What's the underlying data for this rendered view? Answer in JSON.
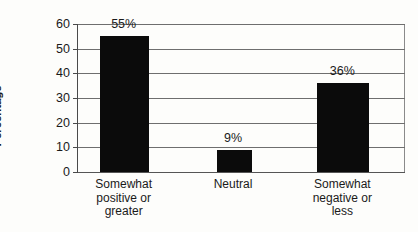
{
  "chart_data": {
    "type": "bar",
    "title": "",
    "subtitle": "",
    "xlabel": "",
    "ylabel": "Percentage",
    "categories": [
      "Somewhat positive or greater",
      "Neutral",
      "Somewhat negative or less"
    ],
    "category_lines": [
      [
        "Somewhat",
        "positive or",
        "greater"
      ],
      [
        "Neutral"
      ],
      [
        "Somewhat",
        "negative or",
        "less"
      ]
    ],
    "values": [
      55,
      9,
      36
    ],
    "value_labels": [
      "55%",
      "9%",
      "36%"
    ],
    "ylim": [
      0,
      60
    ],
    "ytick_values": [
      0,
      10,
      20,
      30,
      40,
      50,
      60
    ],
    "ytick_labels": [
      "0",
      "10",
      "20",
      "30",
      "40",
      "50",
      "60"
    ],
    "grid": true,
    "legend": false,
    "legend_position": "none",
    "bar_color": "#0b0b0b",
    "grid_color": "#6e6e6e",
    "axis_color": "#4a4a4a",
    "background_color": "#fdfdfb"
  }
}
